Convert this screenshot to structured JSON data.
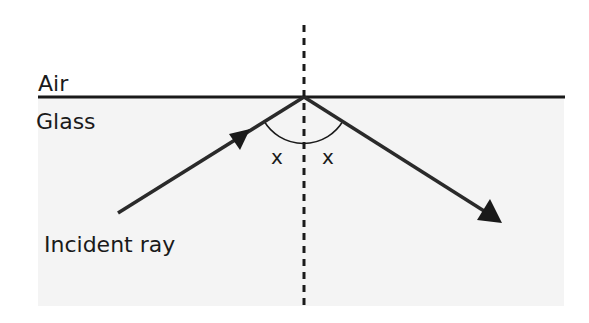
{
  "diagram": {
    "labels": {
      "upper_medium": "Air",
      "lower_medium": "Glass",
      "incident_ray": "Incident ray",
      "angle_left": "x",
      "angle_right": "x"
    },
    "colors": {
      "background": "#ffffff",
      "glass_fill": "#f4f4f4",
      "stroke": "#222222"
    }
  }
}
